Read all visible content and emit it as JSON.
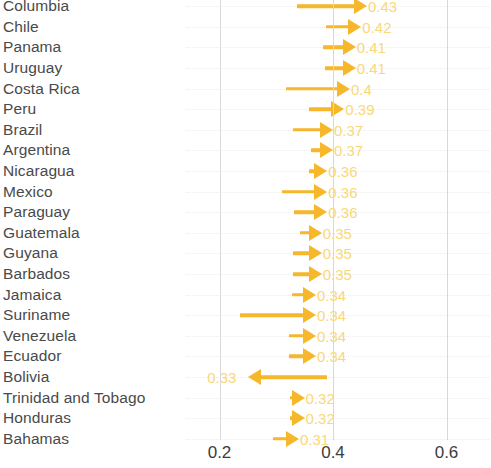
{
  "chart_data": {
    "type": "bar",
    "subtype": "arrow-dot-plot",
    "title": "",
    "xlabel": "",
    "ylabel": "",
    "xlim": [
      0.12,
      0.6597
    ],
    "grid": "dotted-horizontal-and-solid-vertical",
    "legend": null,
    "xticks": [
      0.2,
      0.4,
      0.6
    ],
    "xtick_labels": [
      "0.2",
      "0.4",
      "0.6"
    ],
    "accent_color": "#f6b72b",
    "label_color": "#f9d87a",
    "categories": [
      "Columbia",
      "Chile",
      "Panama",
      "Uruguay",
      "Costa Rica",
      "Peru",
      "Brazil",
      "Argentina",
      "Nicaragua",
      "Mexico",
      "Paraguay",
      "Guatemala",
      "Guyana",
      "Barbados",
      "Jamaica",
      "Suriname",
      "Venezuela",
      "Ecuador",
      "Bolivia",
      "Trinidad and Tobago",
      "Honduras",
      "Bahamas"
    ],
    "values": [
      0.43,
      0.42,
      0.41,
      0.41,
      0.4,
      0.39,
      0.37,
      0.37,
      0.36,
      0.36,
      0.36,
      0.35,
      0.35,
      0.35,
      0.34,
      0.34,
      0.34,
      0.34,
      0.33,
      0.32,
      0.32,
      0.31
    ],
    "value_labels": [
      "0.43",
      "0.42",
      "0.41",
      "0.41",
      "0.4",
      "0.39",
      "0.37",
      "0.37",
      "0.36",
      "0.36",
      "0.36",
      "0.35",
      "0.35",
      "0.35",
      "0.34",
      "0.34",
      "0.34",
      "0.34",
      "0.33",
      "0.32",
      "0.32",
      "0.31"
    ],
    "starts": [
      0.337,
      0.387,
      0.383,
      0.386,
      0.318,
      0.357,
      0.33,
      0.362,
      0.358,
      0.311,
      0.332,
      0.342,
      0.33,
      0.329,
      0.327,
      0.237,
      0.322,
      0.322,
      0.355,
      0.325,
      0.324,
      0.295
    ],
    "directions": [
      "right",
      "right",
      "right",
      "right",
      "right",
      "right",
      "right",
      "right",
      "right",
      "right",
      "right",
      "right",
      "right",
      "right",
      "right",
      "right",
      "right",
      "right",
      "left",
      "right",
      "right",
      "right"
    ]
  }
}
